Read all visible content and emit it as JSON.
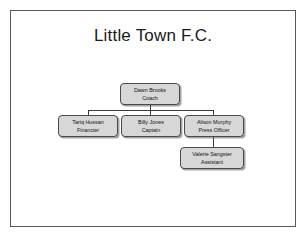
{
  "slide": {
    "title": "Little Town F.C.",
    "background_color": "#ffffff",
    "border_color": "#555a60"
  },
  "chart_data": {
    "type": "diagram",
    "diagram_type": "organizational-chart",
    "title": "Little Town F.C.",
    "node_fill_color": "#d7d7d7",
    "node_border_color": "#4a4a4a",
    "connector_color": "#3a3a3a",
    "nodes": [
      {
        "id": "coach",
        "name": "Dawn Brooks",
        "role": "Coach",
        "level": 0,
        "parent": null
      },
      {
        "id": "financier",
        "name": "Tariq Hussan",
        "role": "Financier",
        "level": 1,
        "parent": "coach"
      },
      {
        "id": "captain",
        "name": "Billy Jones",
        "role": "Captain",
        "level": 1,
        "parent": "coach"
      },
      {
        "id": "press",
        "name": "Alison Murphy",
        "role": "Press Officer",
        "level": 1,
        "parent": "coach"
      },
      {
        "id": "assistant",
        "name": "Valerie Sangster",
        "role": "Assistant",
        "level": 2,
        "parent": "press"
      }
    ],
    "edges": [
      {
        "from": "coach",
        "to": "financier"
      },
      {
        "from": "coach",
        "to": "captain"
      },
      {
        "from": "coach",
        "to": "press"
      },
      {
        "from": "press",
        "to": "assistant"
      }
    ]
  }
}
